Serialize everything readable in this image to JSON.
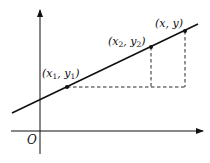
{
  "diagram": {
    "title": "",
    "origin_label": "O",
    "axes": {
      "x_axis": {
        "from": [
          11,
          131
        ],
        "to": [
          204,
          131
        ],
        "arrow": true
      },
      "y_axis": {
        "from": [
          40,
          154
        ],
        "to": [
          40,
          9
        ],
        "arrow": true
      }
    },
    "line": {
      "from": [
        12,
        113
      ],
      "to": [
        198,
        24
      ]
    },
    "points": [
      {
        "id": "p1",
        "label_main": "(x",
        "label_sub": "1",
        "label_mid": ", y",
        "label_sub2": "1",
        "label_end": ")",
        "label_text": "(x1, y1)",
        "x": 67,
        "y": 87
      },
      {
        "id": "p2",
        "label_main": "(x",
        "label_sub": "2",
        "label_mid": ", y",
        "label_sub2": "2",
        "label_end": ")",
        "label_text": "(x2, y2)",
        "x": 151,
        "y": 47
      },
      {
        "id": "p",
        "label_text": "(x, y)",
        "x": 185,
        "y": 31
      }
    ],
    "dashed_lines": [
      {
        "from": [
          67,
          87
        ],
        "to": [
          185,
          87
        ]
      },
      {
        "from": [
          151,
          47
        ],
        "to": [
          151,
          87
        ]
      },
      {
        "from": [
          185,
          31
        ],
        "to": [
          185,
          87
        ]
      }
    ],
    "colors": {
      "stroke": "#111111",
      "background": "#ffffff"
    }
  }
}
